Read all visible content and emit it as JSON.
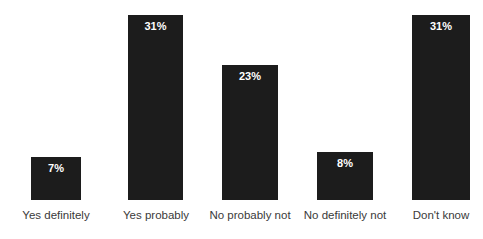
{
  "chart_data": {
    "type": "bar",
    "title": "",
    "subtitle": "",
    "xlabel": "",
    "ylabel": "",
    "ylim": [
      0,
      33.5
    ],
    "grid": false,
    "legend": "none",
    "orientation": "vertical",
    "value_label_position": "inside-top",
    "categories": [
      "Yes definitely",
      "Yes probably",
      "No probably not",
      "No definitely not",
      "Don't know"
    ],
    "values": [
      7,
      31,
      23,
      8,
      31
    ],
    "value_labels": [
      "7%",
      "31%",
      "23%",
      "8%",
      "31%"
    ],
    "colors": {
      "bar_fill": "#1c1c1c",
      "value_label": "#ffffff",
      "category_label": "#3a3a3a",
      "background": "#ffffff"
    },
    "bars": [
      {
        "label": "Yes definitely",
        "value": 7,
        "value_label": "7%",
        "x": 31,
        "width": 50,
        "top": 157,
        "height": 43
      },
      {
        "label": "Yes probably",
        "value": 31,
        "value_label": "31%",
        "x": 128,
        "width": 55,
        "top": 15,
        "height": 185
      },
      {
        "label": "No probably not",
        "value": 23,
        "value_label": "23%",
        "x": 222,
        "width": 56,
        "top": 65,
        "height": 135
      },
      {
        "label": "No definitely not",
        "value": 8,
        "value_label": "8%",
        "x": 317,
        "width": 56,
        "top": 152,
        "height": 48
      },
      {
        "label": "Don't know",
        "value": 31,
        "value_label": "31%",
        "x": 412,
        "width": 58,
        "top": 15,
        "height": 185
      }
    ],
    "label_slots": [
      {
        "text": "Yes definitely",
        "center": 56,
        "width": 130
      },
      {
        "text": "Yes probably",
        "center": 156,
        "width": 130
      },
      {
        "text": "No probably not",
        "center": 250,
        "width": 140
      },
      {
        "text": "No definitely not",
        "center": 345,
        "width": 140
      },
      {
        "text": "Don't know",
        "center": 441,
        "width": 130
      }
    ]
  }
}
